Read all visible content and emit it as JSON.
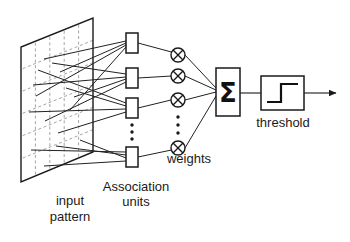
{
  "diagram": {
    "labels": {
      "input_pattern": "input\npattern",
      "input_pattern_line1": "input",
      "input_pattern_line2": "pattern",
      "association_units_line1": "Association",
      "association_units_line2": "units",
      "weights": "weights",
      "threshold": "threshold",
      "summation_symbol": "Σ",
      "multiply_symbol": "⊗"
    },
    "colors": {
      "stroke": "#1a1a1a",
      "grid_dash": "#9a9a9a",
      "background": "#ffffff",
      "text": "#1a1a1a"
    },
    "input_plane": {
      "name": "input-pattern-plane",
      "shape": "parallelogram",
      "corners": [
        [
          93,
          18
        ],
        [
          93,
          152
        ],
        [
          21,
          182
        ],
        [
          21,
          47
        ]
      ],
      "grid_columns": 4,
      "grid_rows": 6,
      "grid_style": "dashed"
    },
    "association_units": {
      "count_shown": 4,
      "has_ellipsis": true,
      "boxes": [
        {
          "id": "assoc-unit-1",
          "x": 126,
          "y": 33,
          "w": 12,
          "h": 20
        },
        {
          "id": "assoc-unit-2",
          "x": 126,
          "y": 68,
          "w": 12,
          "h": 20
        },
        {
          "id": "assoc-unit-3",
          "x": 126,
          "y": 98,
          "w": 12,
          "h": 20
        },
        {
          "id": "assoc-unit-4",
          "x": 126,
          "y": 147,
          "w": 12,
          "h": 20
        }
      ],
      "ellipsis_dots": [
        [
          132,
          125
        ],
        [
          132,
          132
        ],
        [
          132,
          139
        ]
      ]
    },
    "weight_nodes": {
      "count_shown": 4,
      "has_ellipsis": true,
      "circles": [
        {
          "id": "weight-node-1",
          "cx": 178,
          "cy": 55,
          "r": 7
        },
        {
          "id": "weight-node-2",
          "cx": 178,
          "cy": 76,
          "r": 7
        },
        {
          "id": "weight-node-3",
          "cx": 178,
          "cy": 100,
          "r": 7
        },
        {
          "id": "weight-node-4",
          "cx": 178,
          "cy": 148,
          "r": 7
        }
      ],
      "ellipsis_dots": [
        [
          178,
          117
        ],
        [
          178,
          125
        ],
        [
          178,
          133
        ]
      ]
    },
    "summation_box": {
      "id": "summation-box",
      "x": 216,
      "y": 68,
      "w": 24,
      "h": 48,
      "symbol": "Σ"
    },
    "threshold_box": {
      "id": "threshold-box",
      "x": 261,
      "y": 76,
      "w": 43,
      "h": 34,
      "glyph": "step-function"
    },
    "output_arrow": {
      "id": "output-arrow",
      "from_x": 304,
      "to_x": 338,
      "y": 93
    },
    "connections": {
      "input_to_assoc_count": 16,
      "assoc_to_weight_count": 4,
      "weight_to_sum_count": 4
    }
  }
}
